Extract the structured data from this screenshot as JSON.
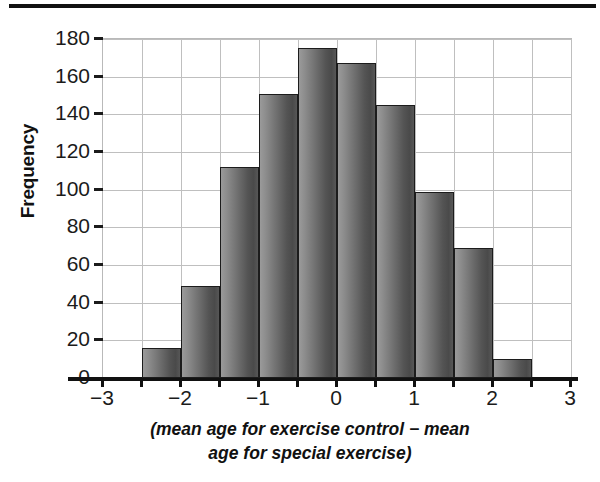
{
  "figure": {
    "top_rule": "horizontal-rule",
    "y_axis_title": "Frequency",
    "x_axis_caption_line1": "(mean age for exercise control − mean",
    "x_axis_caption_line2": "age for special exercise)"
  },
  "chart_data": {
    "type": "bar",
    "title": "",
    "xlabel": "(mean age for exercise control − mean age for special exercise)",
    "ylabel": "Frequency",
    "xlim": [
      -3,
      3
    ],
    "ylim": [
      0,
      180
    ],
    "grid": true,
    "legend": null,
    "bin_width": 0.5,
    "bin_edges": [
      -2.5,
      -2.0,
      -1.5,
      -1.0,
      -0.5,
      0.0,
      0.5,
      1.0,
      1.5,
      2.0,
      2.5
    ],
    "bin_centers": [
      -2.25,
      -1.75,
      -1.25,
      -0.75,
      -0.25,
      0.25,
      0.75,
      1.25,
      1.75,
      2.25
    ],
    "values": [
      16,
      49,
      112,
      151,
      175,
      167,
      145,
      99,
      69,
      10
    ],
    "categories": [
      "-2.5 to -2.0",
      "-2.0 to -1.5",
      "-1.5 to -1.0",
      "-1.0 to -0.5",
      "-0.5 to 0.0",
      "0.0 to 0.5",
      "0.5 to 1.0",
      "1.0 to 1.5",
      "1.5 to 2.0",
      "2.0 to 2.5"
    ],
    "y_ticks": [
      0,
      20,
      40,
      60,
      80,
      100,
      120,
      140,
      160,
      180
    ],
    "y_tick_labels": [
      "0",
      "20",
      "40",
      "60",
      "80",
      "100",
      "120",
      "140",
      "160",
      "180"
    ],
    "x_ticks": [
      -3,
      -2.5,
      -2,
      -1.5,
      -1,
      -0.5,
      0,
      0.5,
      1,
      1.5,
      2,
      2.5,
      3
    ],
    "x_tick_labels": [
      "−3",
      "",
      "−2",
      "",
      "−1",
      "",
      "0",
      "",
      "1",
      "",
      "2",
      "",
      "3"
    ],
    "x_major_ticks": [
      -3,
      -2,
      -1,
      0,
      1,
      2,
      3
    ],
    "x_major_tick_labels": [
      "−3",
      "−2",
      "−1",
      "0",
      "1",
      "2",
      "3"
    ],
    "bar_fill_left": "#9a9a9a",
    "bar_fill_right": "#4a4a4a",
    "bar_edge": "#1c1c1c",
    "grid_color": "#bfbfbf",
    "axis_color": "#111111",
    "background": "#ffffff"
  }
}
